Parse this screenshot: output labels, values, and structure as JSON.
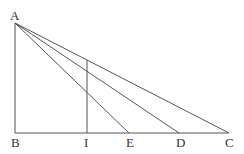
{
  "diagram": {
    "title": "",
    "points": {
      "A": {
        "label": "A",
        "x": 15,
        "y": 23
      },
      "B": {
        "label": "B",
        "x": 15,
        "y": 133
      },
      "I": {
        "label": "I",
        "x": 87,
        "y": 133
      },
      "E": {
        "label": "E",
        "x": 129,
        "y": 133
      },
      "D": {
        "label": "D",
        "x": 179,
        "y": 133
      },
      "C": {
        "label": "C",
        "x": 229,
        "y": 133
      }
    },
    "segments": [
      "AB",
      "BC",
      "AE",
      "AD",
      "AC",
      "I-vertical-to-AC"
    ],
    "labels": [
      "A",
      "B",
      "I",
      "E",
      "D",
      "C"
    ]
  }
}
